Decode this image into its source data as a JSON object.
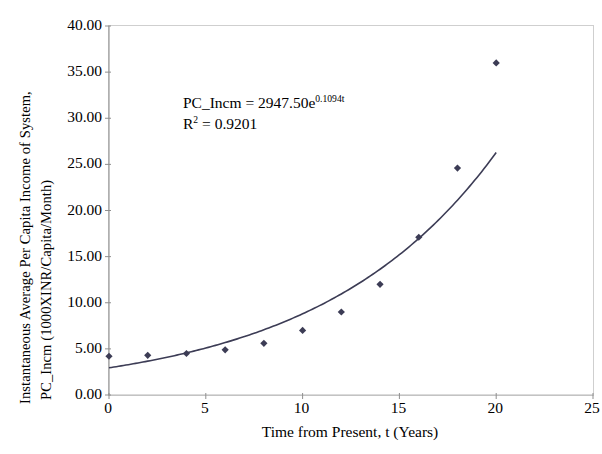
{
  "chart_data": {
    "type": "scatter",
    "title": "",
    "xlabel": "Time from Present, t (Years)",
    "ylabel_line1": "Instantaneous Average Per Capita Income of System,",
    "ylabel_line2": "PC_Incm (1000XINR/Capita/Month)",
    "xlim": [
      0,
      25
    ],
    "ylim": [
      0,
      40
    ],
    "xticks": [
      0,
      5,
      10,
      15,
      20,
      25
    ],
    "xtick_labels": [
      "0",
      "5",
      "10",
      "15",
      "20",
      "25"
    ],
    "yticks": [
      0,
      5,
      10,
      15,
      20,
      25,
      30,
      35,
      40
    ],
    "ytick_labels": [
      "0.00",
      "5.00",
      "10.00",
      "15.00",
      "20.00",
      "25.00",
      "30.00",
      "35.00",
      "40.00"
    ],
    "grid": false,
    "legend": "none",
    "marker_shape": "diamond",
    "marker_color": "#3c3c55",
    "trendline_color": "#3c3c55",
    "series": [
      {
        "name": "PC_Incm",
        "x": [
          0,
          2,
          4,
          6,
          8,
          10,
          12,
          14,
          16,
          18,
          20
        ],
        "values": [
          4.2,
          4.3,
          4.5,
          4.9,
          5.6,
          7.0,
          9.0,
          12.0,
          17.1,
          24.6,
          36.0
        ]
      }
    ],
    "trendline": {
      "type": "exponential",
      "coefficient": 2947.5,
      "rate": 0.1094,
      "x_start": 0,
      "x_end": 20,
      "scale": 0.001,
      "equation_label": "PC_Incm = 2947.50e",
      "equation_exponent": "0.1094t",
      "r2_prefix": "R",
      "r2_superscript": "2",
      "r2_value": " = 0.9201"
    }
  },
  "annotation": {
    "equation_prefix": "PC_Incm = 2947.50e",
    "equation_exponent": "0.1094t",
    "r2_prefix": "R",
    "r2_superscript": "2",
    "r2_rest": " = 0.9201"
  }
}
